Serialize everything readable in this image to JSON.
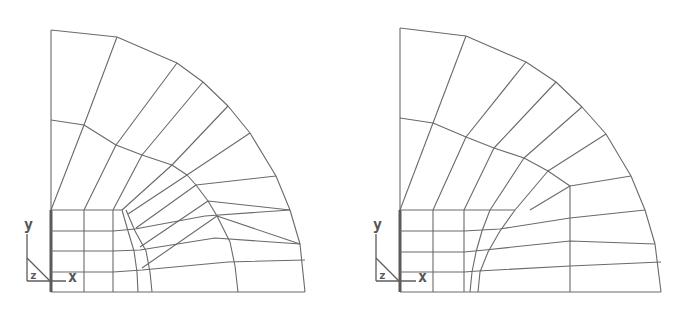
{
  "figure": {
    "line_color": "#6a6a6a",
    "background": "#ffffff"
  },
  "meshes": [
    {
      "id": "left",
      "origin": [
        51,
        292
      ],
      "outer_arc": [
        [
          51,
          30
        ],
        [
          117,
          37
        ],
        [
          177,
          63
        ],
        [
          203,
          82
        ],
        [
          228,
          106
        ],
        [
          250,
          133
        ],
        [
          276,
          176
        ],
        [
          290,
          210
        ],
        [
          300,
          244
        ],
        [
          305,
          292
        ]
      ],
      "middle_arc": [
        [
          51,
          120
        ],
        [
          84,
          125
        ],
        [
          116,
          145
        ],
        [
          142,
          155
        ],
        [
          172,
          165
        ],
        [
          187,
          175
        ],
        [
          196,
          185
        ],
        [
          208,
          201
        ],
        [
          217,
          216
        ],
        [
          230,
          242
        ],
        [
          235,
          266
        ],
        [
          238,
          292
        ]
      ],
      "radials": [
        [
          [
            51,
            210
          ],
          [
            84,
            125
          ],
          [
            117,
            37
          ]
        ],
        [
          [
            84,
            210
          ],
          [
            116,
            145
          ],
          [
            177,
            63
          ]
        ],
        [
          [
            113,
            210
          ],
          [
            142,
            155
          ],
          [
            203,
            82
          ]
        ],
        [
          [
            122,
            210
          ],
          [
            172,
            165
          ],
          [
            228,
            106
          ]
        ],
        [
          [
            128,
            214
          ],
          [
            187,
            175
          ],
          [
            250,
            133
          ]
        ],
        [
          [
            136,
            228
          ],
          [
            196,
            185
          ],
          [
            276,
            176
          ]
        ],
        [
          [
            140,
            247
          ],
          [
            208,
            201
          ],
          [
            290,
            210
          ]
        ],
        [
          [
            142,
            268
          ],
          [
            217,
            216
          ],
          [
            300,
            244
          ]
        ]
      ],
      "fan_from_corner": [
        [
          51,
          210
        ],
        [
          51,
          30
        ]
      ],
      "grid": {
        "x_lines": [
          51,
          84,
          113
        ],
        "y_lines": [
          210,
          231,
          251,
          272,
          292
        ],
        "x_max": 122
      },
      "rows": [
        [
          [
            113,
            231
          ],
          [
            135,
            229
          ],
          [
            205,
            216
          ],
          [
            290,
            210
          ]
        ],
        [
          [
            113,
            251
          ],
          [
            140,
            250
          ],
          [
            215,
            238
          ],
          [
            300,
            244
          ]
        ],
        [
          [
            113,
            272
          ],
          [
            142,
            270
          ],
          [
            228,
            262
          ],
          [
            305,
            260
          ]
        ]
      ],
      "inner_curves": [
        [
          [
            122,
            210
          ],
          [
            128,
            231
          ],
          [
            134,
            251
          ],
          [
            137,
            272
          ],
          [
            138,
            292
          ]
        ],
        [
          [
            126,
            210
          ],
          [
            135,
            231
          ],
          [
            146,
            251
          ],
          [
            150,
            272
          ],
          [
            152,
            292
          ]
        ]
      ],
      "bottom": [
        [
          51,
          292
        ],
        [
          305,
          292
        ]
      ],
      "triad": {
        "origin": [
          27,
          281
        ],
        "y_label": "y",
        "x_label": "x",
        "z_label": "z",
        "y_label_pos": [
          24,
          230
        ],
        "x_label_pos": [
          68,
          282
        ],
        "z_label_pos": [
          30,
          279
        ],
        "diag": [
          [
            27,
            258
          ],
          [
            50,
            281
          ]
        ],
        "vert": [
          [
            27,
            234
          ],
          [
            27,
            281
          ]
        ],
        "horiz": [
          [
            27,
            281
          ],
          [
            66,
            281
          ]
        ]
      }
    },
    {
      "id": "right",
      "origin": [
        400,
        292
      ],
      "outer_arc": [
        [
          400,
          28
        ],
        [
          466,
          36
        ],
        [
          526,
          62
        ],
        [
          556,
          82
        ],
        [
          582,
          107
        ],
        [
          606,
          134
        ],
        [
          631,
          176
        ],
        [
          645,
          210
        ],
        [
          655,
          244
        ],
        [
          661,
          292
        ]
      ],
      "middle_arc": [
        [
          400,
          118
        ],
        [
          433,
          123
        ],
        [
          466,
          137
        ],
        [
          494,
          148
        ],
        [
          524,
          158
        ],
        [
          548,
          171
        ],
        [
          570,
          186
        ],
        [
          570,
          292
        ]
      ],
      "radials": [
        [
          [
            400,
            210
          ],
          [
            433,
            123
          ],
          [
            466,
            36
          ]
        ],
        [
          [
            433,
            210
          ],
          [
            466,
            137
          ],
          [
            526,
            62
          ]
        ],
        [
          [
            464,
            210
          ],
          [
            494,
            148
          ],
          [
            556,
            82
          ]
        ],
        [
          [
            490,
            210
          ],
          [
            524,
            158
          ],
          [
            582,
            107
          ]
        ],
        [
          [
            515,
            210
          ],
          [
            548,
            171
          ],
          [
            606,
            134
          ]
        ],
        [
          [
            530,
            210
          ],
          [
            570,
            186
          ],
          [
            631,
            176
          ]
        ]
      ],
      "fan_from_corner": [
        [
          400,
          210
        ],
        [
          400,
          28
        ]
      ],
      "grid": {
        "x_lines": [
          400,
          433,
          464
        ],
        "y_lines": [
          210,
          231,
          252,
          272,
          292
        ],
        "x_max": 515
      },
      "rows": [
        [
          [
            464,
            231
          ],
          [
            500,
            229
          ],
          [
            570,
            218
          ],
          [
            645,
            210
          ]
        ],
        [
          [
            464,
            252
          ],
          [
            485,
            250
          ],
          [
            570,
            241
          ],
          [
            655,
            244
          ]
        ],
        [
          [
            464,
            272
          ],
          [
            478,
            271
          ],
          [
            570,
            266
          ],
          [
            661,
            262
          ]
        ]
      ],
      "inner_curves": [
        [
          [
            490,
            210
          ],
          [
            482,
            231
          ],
          [
            476,
            252
          ],
          [
            472,
            272
          ],
          [
            470,
            292
          ]
        ],
        [
          [
            515,
            210
          ],
          [
            500,
            231
          ],
          [
            488,
            252
          ],
          [
            480,
            272
          ],
          [
            478,
            292
          ]
        ]
      ],
      "bottom": [
        [
          400,
          292
        ],
        [
          661,
          292
        ]
      ],
      "triad": {
        "origin": [
          376,
          281
        ],
        "y_label": "y",
        "x_label": "x",
        "z_label": "z",
        "y_label_pos": [
          373,
          230
        ],
        "x_label_pos": [
          418,
          282
        ],
        "z_label_pos": [
          379,
          279
        ],
        "diag": [
          [
            376,
            258
          ],
          [
            399,
            281
          ]
        ],
        "vert": [
          [
            376,
            234
          ],
          [
            376,
            281
          ]
        ],
        "horiz": [
          [
            376,
            281
          ],
          [
            416,
            281
          ]
        ]
      }
    }
  ]
}
